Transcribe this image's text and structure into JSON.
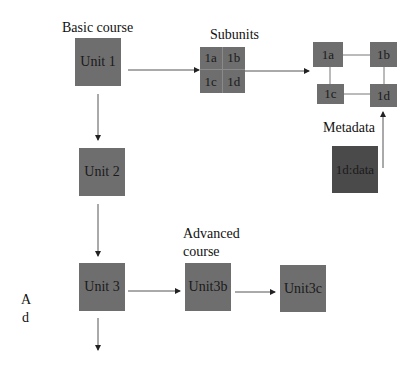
{
  "diagram": {
    "labels": {
      "basic_course": "Basic course",
      "subunits": "Subunits",
      "metadata": "Metadata",
      "advanced_course_line1": "Advanced",
      "advanced_course_line2": "course",
      "side_a": "A",
      "side_d": "d"
    },
    "nodes": {
      "unit1": "Unit 1",
      "unit2": "Unit 2",
      "unit3": "Unit 3",
      "unit3b": "Unit3b",
      "unit3c": "Unit3c",
      "sub_1a": "1a",
      "sub_1b": "1b",
      "sub_1c": "1c",
      "sub_1d": "1d",
      "grid_1a": "1a",
      "grid_1b": "1b",
      "grid_1c": "1c",
      "grid_1d": "1d",
      "data_1d": "1d:data"
    },
    "colors": {
      "node": "#6e6e6e",
      "node_dark": "#4a4a4a",
      "edge": "#333333"
    }
  }
}
